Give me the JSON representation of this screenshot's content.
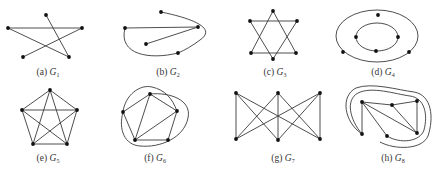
{
  "figure": {
    "panels": [
      {
        "id": "a",
        "label": "(a)",
        "graph": "G",
        "sub": "1",
        "caption_x": 48,
        "caption_y": 75,
        "vertices": [
          [
            46,
            15
          ],
          [
            8,
            28
          ],
          [
            82,
            28
          ],
          [
            23,
            57
          ],
          [
            69,
            57
          ]
        ],
        "edges": [
          [
            1,
            2
          ],
          [
            1,
            4
          ],
          [
            0,
            4
          ],
          [
            2,
            3
          ]
        ],
        "curves": []
      },
      {
        "id": "b",
        "label": "(b)",
        "graph": "G",
        "sub": "2",
        "caption_x": 168,
        "caption_y": 75,
        "vertices": [
          [
            161,
            12
          ],
          [
            125,
            28
          ],
          [
            198,
            27
          ],
          [
            146,
            44
          ],
          [
            178,
            53
          ]
        ],
        "edges": [
          [
            1,
            2
          ],
          [
            3,
            2
          ]
        ],
        "curves": [
          "M161,12 C200,20 215,30 200,40 C192,46 185,50 178,53",
          "M125,28 C118,55 150,60 178,53"
        ]
      },
      {
        "id": "c",
        "label": "(c)",
        "graph": "G",
        "sub": "3",
        "caption_x": 275,
        "caption_y": 75,
        "vertices": [
          [
            273,
            11
          ],
          [
            250,
            21
          ],
          [
            297,
            21
          ],
          [
            251,
            53
          ],
          [
            296,
            53
          ],
          [
            273,
            59
          ]
        ],
        "edges": [
          [
            0,
            3
          ],
          [
            3,
            4
          ],
          [
            4,
            0
          ],
          [
            1,
            2
          ],
          [
            2,
            5
          ],
          [
            5,
            1
          ]
        ],
        "curves": []
      },
      {
        "id": "d",
        "label": "(d)",
        "graph": "G",
        "sub": "4",
        "caption_x": 383,
        "caption_y": 75,
        "vertices": [
          [
            378,
            15
          ],
          [
            343,
            52
          ],
          [
            409,
            52
          ],
          [
            356,
            37
          ],
          [
            398,
            37
          ],
          [
            376,
            51
          ]
        ],
        "edges": [],
        "ellipses": [
          {
            "cx": 377,
            "cy": 36,
            "rx": 41,
            "ry": 26
          },
          {
            "cx": 377,
            "cy": 37,
            "rx": 21,
            "ry": 14
          }
        ]
      },
      {
        "id": "e",
        "label": "(e)",
        "graph": "G",
        "sub": "5",
        "caption_x": 48,
        "caption_y": 161,
        "vertices": [
          [
            50,
            90
          ],
          [
            22,
            110
          ],
          [
            77,
            110
          ],
          [
            33,
            144
          ],
          [
            67,
            144
          ]
        ],
        "edges": [
          [
            0,
            1
          ],
          [
            0,
            2
          ],
          [
            0,
            3
          ],
          [
            0,
            4
          ],
          [
            1,
            2
          ],
          [
            1,
            3
          ],
          [
            1,
            4
          ],
          [
            2,
            3
          ],
          [
            2,
            4
          ],
          [
            3,
            4
          ]
        ],
        "curves": []
      },
      {
        "id": "f",
        "label": "(f)",
        "graph": "G",
        "sub": "6",
        "caption_x": 155,
        "caption_y": 161,
        "vertices": [
          [
            150,
            94
          ],
          [
            123,
            112
          ],
          [
            177,
            111
          ],
          [
            135,
            140
          ],
          [
            168,
            140
          ]
        ],
        "edges": [
          [
            0,
            1
          ],
          [
            1,
            3
          ],
          [
            3,
            4
          ],
          [
            4,
            2
          ],
          [
            2,
            0
          ],
          [
            0,
            3
          ],
          [
            2,
            3
          ]
        ],
        "curves": [
          "M123,112 C125,95 140,84 152,87 C165,90 172,98 177,111",
          "M150,94 C170,92 192,100 188,118 C184,138 160,148 140,146 C125,145 118,130 123,112"
        ]
      },
      {
        "id": "g",
        "label": "(g)",
        "graph": "G",
        "sub": "7",
        "caption_x": 283,
        "caption_y": 161,
        "vertices": [
          [
            236,
            93
          ],
          [
            278,
            93
          ],
          [
            320,
            93
          ],
          [
            236,
            139
          ],
          [
            278,
            140
          ],
          [
            320,
            139
          ]
        ],
        "edges": [
          [
            0,
            3
          ],
          [
            0,
            4
          ],
          [
            0,
            5
          ],
          [
            1,
            3
          ],
          [
            1,
            4
          ],
          [
            1,
            5
          ],
          [
            2,
            3
          ],
          [
            2,
            4
          ],
          [
            2,
            5
          ]
        ],
        "curves": []
      },
      {
        "id": "h",
        "label": "(h)",
        "graph": "G",
        "sub": "8",
        "caption_x": 393,
        "caption_y": 161,
        "vertices": [
          [
            362,
            102
          ],
          [
            392,
            105
          ],
          [
            417,
            101
          ],
          [
            417,
            133
          ],
          [
            387,
            136
          ],
          [
            362,
            134
          ]
        ],
        "edges": [
          [
            0,
            5
          ],
          [
            0,
            3
          ],
          [
            0,
            4
          ],
          [
            1,
            2
          ],
          [
            1,
            3
          ],
          [
            2,
            3
          ],
          [
            0,
            1
          ]
        ],
        "curves": [
          "M362,134 C350,120 345,100 358,93 C372,86 395,94 410,96 C425,98 428,115 424,130 C420,142 400,144 387,136",
          "M362,134 C344,122 340,96 356,88 C372,82 398,90 414,92 C432,95 434,118 428,136 C422,150 395,150 380,142"
        ]
      }
    ]
  }
}
